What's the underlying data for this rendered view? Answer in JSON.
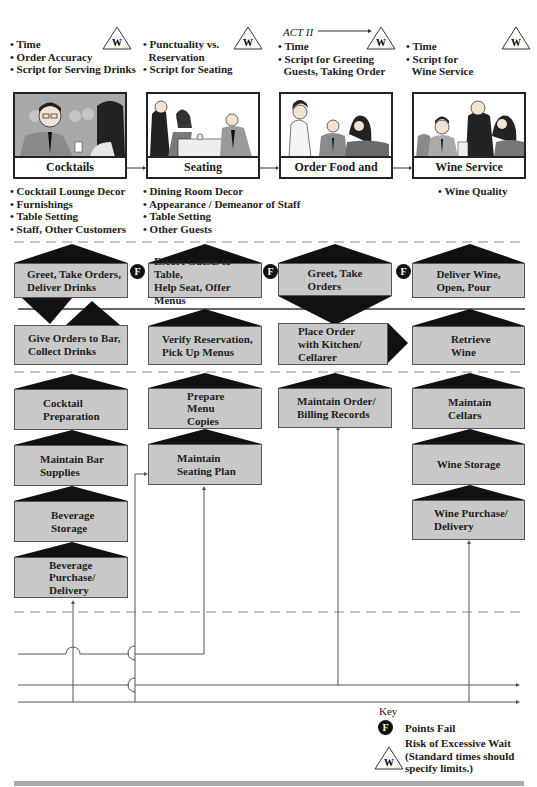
{
  "acts": {
    "act_label": "ACT II"
  },
  "scenes": [
    {
      "id": "cocktails",
      "title": "Cocktails",
      "standards": [
        "Time",
        "Order Accuracy",
        "Script for Serving Drinks"
      ],
      "evidence": [
        "Cocktail Lounge Decor",
        "Furnishings",
        "Table Setting",
        "Staff, Other Customers"
      ]
    },
    {
      "id": "seating",
      "title": "Seating",
      "standards": [
        "Punctuality vs.",
        "Reservation",
        "Script for Seating"
      ],
      "evidence": [
        "Dining Room Decor",
        "Appearance / Demeanor of Staff",
        "Table Setting",
        "Other Guests"
      ]
    },
    {
      "id": "order",
      "title": "Order Food and Wine",
      "standards": [
        "Time",
        "Script for Greeting",
        "Guests, Taking Order"
      ],
      "evidence": []
    },
    {
      "id": "wine",
      "title": "Wine Service",
      "standards": [
        "Time",
        "Script for",
        "Wine Service"
      ],
      "evidence": [
        "Wine Quality"
      ]
    }
  ],
  "onstage": [
    {
      "label1": "Greet, Take Orders,",
      "label2": "Deliver Drinks"
    },
    {
      "label1": "Escort Guests to Table,",
      "label2": "Help Seat, Offer Menus"
    },
    {
      "label1": "Greet, Take",
      "label2": "Orders"
    },
    {
      "label1": "Deliver Wine,",
      "label2": "Open, Pour"
    }
  ],
  "backstage": [
    {
      "label1": "Give Orders to Bar,",
      "label2": "Collect Drinks"
    },
    {
      "label1": "Verify Reservation,",
      "label2": "Pick Up Menus"
    },
    {
      "label1": "Place Order",
      "label2": "with Kitchen/",
      "label3": "Cellarer"
    },
    {
      "label1": "Retrieve",
      "label2": "Wine"
    }
  ],
  "support": {
    "cocktails": [
      {
        "label1": "Cocktail",
        "label2": "Preparation"
      },
      {
        "label1": "Maintain Bar",
        "label2": "Supplies"
      },
      {
        "label1": "Beverage",
        "label2": "Storage"
      },
      {
        "label1": "Beverage",
        "label2": "Purchase/",
        "label3": "Delivery"
      }
    ],
    "seating": [
      {
        "label1": "Prepare",
        "label2": "Menu",
        "label3": "Copies"
      },
      {
        "label1": "Maintain",
        "label2": "Seating Plan"
      }
    ],
    "order": [
      {
        "label1": "Maintain Order/",
        "label2": "Billing Records"
      }
    ],
    "wine": [
      {
        "label1": "Maintain",
        "label2": "Cellars"
      },
      {
        "label1": "Wine Storage"
      },
      {
        "label1": "Wine Purchase/",
        "label2": "Delivery"
      }
    ]
  },
  "icons": {
    "fail_letter": "F",
    "wait_letter": "W"
  },
  "key": {
    "title": "Key",
    "fail_label": "Points Fail",
    "wait_label1": "Risk of Excessive Wait",
    "wait_label2": "(Standard times should",
    "wait_label3": "specify limits.)"
  },
  "colors": {
    "box_fill": "#c8c8c8",
    "arrow_fill": "#111111",
    "line": "#444444",
    "dash": "#888888"
  }
}
